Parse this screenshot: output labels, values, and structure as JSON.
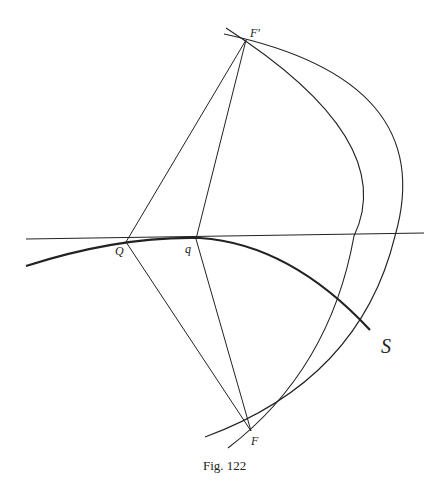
{
  "figure": {
    "caption": "Fig. 122",
    "points": {
      "F_prime": {
        "label": "F'",
        "x": 246,
        "y": 40
      },
      "F": {
        "label": "F",
        "x": 251,
        "y": 431
      },
      "Q": {
        "label": "Q",
        "x": 126,
        "y": 242
      },
      "q": {
        "label": "q",
        "x": 196,
        "y": 239
      }
    },
    "curve_label": "S",
    "colors": {
      "stroke": "#222222",
      "background": "#ffffff"
    }
  }
}
